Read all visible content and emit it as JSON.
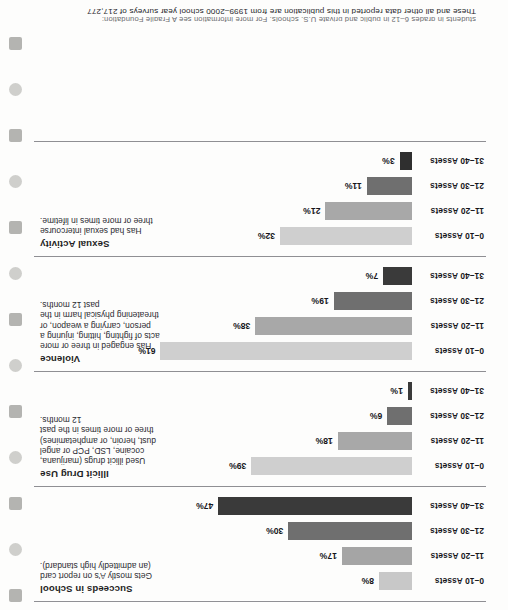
{
  "page": {
    "footnote_clipped": "students in grades 6–12 in public and private U.S. schools. For more information see A Fragile Foundation:",
    "footnote": "These and all other data reported in this publication are from 1999–2000 school year surveys of 217,277"
  },
  "binding": {
    "hole_count": 13,
    "shapes": [
      "sq",
      "round",
      "sq",
      "round",
      "sq",
      "round",
      "sq",
      "round",
      "sq",
      "round",
      "sq",
      "round",
      "sq"
    ]
  },
  "chart_data": {
    "type": "bar",
    "title": "",
    "orientation": "horizontal",
    "categories": [
      "0–10 Assets",
      "11–20 Assets",
      "21–30 Assets",
      "31–40 Assets"
    ],
    "xlabel": "",
    "ylabel": "",
    "xlim": [
      0,
      65
    ],
    "grid": false,
    "legend": "none",
    "value_suffix": "%",
    "series": [
      {
        "name": "Succeeds in School",
        "description": "Gets mostly A's on report card (an admittedly high standard).",
        "values": [
          8,
          17,
          30,
          47
        ],
        "labels": [
          "8%",
          "17%",
          "30%",
          "47%"
        ],
        "colors": [
          "#c8c8c8",
          "#a5a5a5",
          "#6f6f6f",
          "#3a3a3a"
        ]
      },
      {
        "name": "Illicit Drug Use",
        "description": "Used illicit drugs (marijuana, cocaine, LSD, PCP or angel dust, heroin, or amphetamines) three or more times in the past 12 months.",
        "values": [
          39,
          18,
          6,
          1
        ],
        "labels": [
          "39%",
          "18%",
          "6%",
          "1%"
        ],
        "colors": [
          "#cfcfcf",
          "#a8a8a8",
          "#6f6f6f",
          "#3a3a3a"
        ]
      },
      {
        "name": "Violence",
        "description": "Has engaged in three or more acts of fighting, hitting, injuring a person, carrying a weapon, or threatening physical harm in the past 12 months.",
        "values": [
          61,
          38,
          19,
          7
        ],
        "labels": [
          "61%",
          "38%",
          "19%",
          "7%"
        ],
        "colors": [
          "#cfcfcf",
          "#a8a8a8",
          "#6f6f6f",
          "#3a3a3a"
        ]
      },
      {
        "name": "Sexual Activity",
        "description": "Has had sexual intercourse three or more times in lifetime.",
        "values": [
          32,
          21,
          11,
          3
        ],
        "labels": [
          "32%",
          "21%",
          "11%",
          "3%"
        ],
        "colors": [
          "#cfcfcf",
          "#a8a8a8",
          "#6f6f6f",
          "#2f2f2f"
        ]
      }
    ]
  }
}
